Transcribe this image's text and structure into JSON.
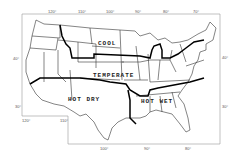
{
  "zones": [
    {
      "id": "cool",
      "label": "COOL"
    },
    {
      "id": "temperate",
      "label": "TEMPERATE"
    },
    {
      "id": "hot-dry",
      "label": "HOT DRY"
    },
    {
      "id": "hot-wet",
      "label": "HOT WET"
    }
  ],
  "ticks": {
    "top": [
      "120°",
      "110°",
      "100°",
      "90°",
      "80°",
      "70°"
    ],
    "left": [
      "40°",
      "30°"
    ],
    "right": [
      "40°",
      "30°"
    ],
    "bottom_left": [
      "120°",
      "110°"
    ],
    "bottom": [
      "100°",
      "90°",
      "80°"
    ]
  },
  "colors": {
    "background": "#ffffff",
    "state_lines": "#333333",
    "zone_boundaries": "#000000",
    "frame": "#888888"
  }
}
